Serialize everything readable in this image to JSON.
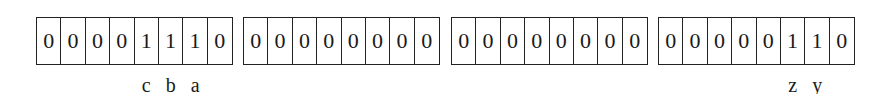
{
  "bytes": [
    {
      "bits": [
        "0",
        "0",
        "0",
        "0",
        "1",
        "1",
        "1",
        "0"
      ]
    },
    {
      "bits": [
        "0",
        "0",
        "0",
        "0",
        "0",
        "0",
        "0",
        "0"
      ]
    },
    {
      "bits": [
        "0",
        "0",
        "0",
        "0",
        "0",
        "0",
        "0",
        "0"
      ]
    },
    {
      "bits": [
        "0",
        "0",
        "0",
        "0",
        "0",
        "1",
        "1",
        "0"
      ]
    }
  ],
  "labels": {
    "byte0": {
      "bit4": "c",
      "bit5": "b",
      "bit6": "a"
    },
    "byte3": {
      "bit5": "z",
      "bit6": "y"
    }
  }
}
